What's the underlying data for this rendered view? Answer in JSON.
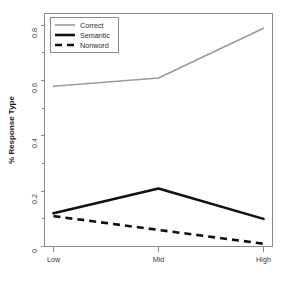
{
  "chart_data": {
    "type": "line",
    "title": "",
    "xlabel": "",
    "ylabel": "% Response Type",
    "categories": [
      "Low",
      "Mid",
      "High"
    ],
    "x": [
      0,
      1,
      2
    ],
    "ylim": [
      0,
      0.84
    ],
    "xlim": [
      -0.12,
      2.12
    ],
    "grid": false,
    "legend_position": "top-left",
    "y_ticks": [
      0,
      0.2,
      0.4,
      0.6,
      0.8
    ],
    "y_tick_labels": [
      "0",
      "0.2",
      "0.4",
      "0.6",
      "0.8"
    ],
    "y_minor_ticks": [
      0.1,
      0.3,
      0.5,
      0.7
    ],
    "x_tick_labels": [
      "Low",
      "Mid",
      "High"
    ],
    "series": [
      {
        "name": "Correct",
        "values": [
          0.58,
          0.61,
          0.79
        ],
        "color": "#9a9a9a",
        "style": "solid",
        "width": 1.6
      },
      {
        "name": "Semantic",
        "values": [
          0.12,
          0.21,
          0.1
        ],
        "color": "#111111",
        "style": "solid",
        "width": 2.6
      },
      {
        "name": "Nonword",
        "values": [
          0.11,
          0.06,
          0.01
        ],
        "color": "#111111",
        "style": "dashed",
        "width": 2.6
      }
    ]
  },
  "legend": {
    "entries": [
      {
        "label": "Correct"
      },
      {
        "label": "Semantic"
      },
      {
        "label": "Nonword"
      }
    ]
  },
  "axes": {
    "y_title": "% Response Type",
    "y_labels": [
      "0.8",
      "0.6",
      "0.4",
      "0.2",
      "0"
    ],
    "x_labels": [
      "Low",
      "Mid",
      "High"
    ]
  }
}
